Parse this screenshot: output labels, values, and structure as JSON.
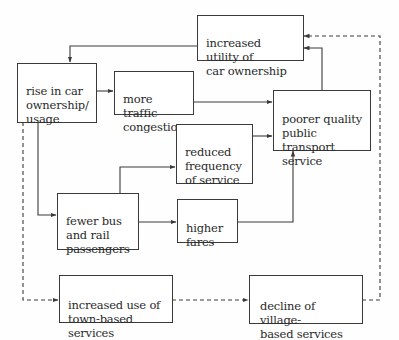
{
  "diagram": {
    "type": "flow-diagram",
    "colors": {
      "line": "#3a3a3a",
      "text": "#2a2a2a",
      "background": "#ffffff"
    },
    "nodes": {
      "utility": {
        "label": "increased utility of\ncar ownership"
      },
      "rise": {
        "label": "rise in car\nownership/\nusage"
      },
      "traffic": {
        "label": "more traffic\ncongestion"
      },
      "poorer": {
        "label": "poorer quality\npublic transport\nservice"
      },
      "reduced": {
        "label": "reduced\nfrequency\nof service"
      },
      "fewer": {
        "label": "fewer bus\nand rail\npassengers"
      },
      "higher": {
        "label": "higher\nfares"
      },
      "town": {
        "label": "increased use of\ntown-based services"
      },
      "decline": {
        "label": "decline of village-\nbased services"
      }
    },
    "edges": [
      {
        "from": "utility",
        "to": "rise",
        "style": "solid"
      },
      {
        "from": "rise",
        "to": "traffic",
        "style": "solid"
      },
      {
        "from": "traffic",
        "to": "poorer",
        "style": "solid"
      },
      {
        "from": "poorer",
        "to": "utility",
        "style": "solid"
      },
      {
        "from": "rise",
        "to": "fewer",
        "style": "solid"
      },
      {
        "from": "fewer",
        "to": "reduced",
        "style": "solid"
      },
      {
        "from": "fewer",
        "to": "higher",
        "style": "solid"
      },
      {
        "from": "reduced",
        "to": "poorer",
        "style": "solid"
      },
      {
        "from": "higher",
        "to": "poorer",
        "style": "solid"
      },
      {
        "from": "rise",
        "to": "town",
        "style": "dashed"
      },
      {
        "from": "town",
        "to": "decline",
        "style": "dashed"
      },
      {
        "from": "decline",
        "to": "utility",
        "style": "dashed"
      }
    ]
  }
}
